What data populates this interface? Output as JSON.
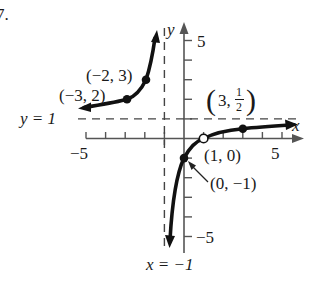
{
  "exercise_label": "7.",
  "graph": {
    "origin_px": [
      184,
      138.5
    ],
    "unit_px": 19.6,
    "x_axis_label": "x",
    "y_axis_label": "y",
    "x_tick_labels": {
      "neg5": "−5",
      "pos5": "5"
    },
    "y_tick_labels": {
      "pos5": "5",
      "neg5": "−5"
    },
    "asymptotes": {
      "horizontal": {
        "label": "y = 1",
        "value": 1
      },
      "vertical": {
        "label": "x = −1",
        "value": -1
      }
    },
    "points": [
      {
        "label": "(−2, 3)",
        "x": -2,
        "y": 3,
        "style": "filled"
      },
      {
        "label": "(−3, 2)",
        "x": -3,
        "y": 2,
        "style": "filled"
      },
      {
        "label": "(3, ½)",
        "x": 3,
        "y": 0.5,
        "style": "filled"
      },
      {
        "label": "(1, 0)",
        "x": 1,
        "y": 0,
        "style": "open"
      },
      {
        "label": "(0, −1)",
        "x": 0,
        "y": -1,
        "style": "filled"
      }
    ],
    "function": "y = (x - 1)/(x + 1)"
  }
}
